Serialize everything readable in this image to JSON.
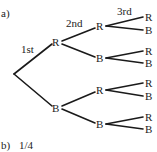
{
  "part_a": {
    "label": "a)",
    "stage_labels": [
      "1st",
      "2nd",
      "3rd"
    ],
    "tree": {
      "level1": [
        "R",
        "B"
      ],
      "level2": [
        "R",
        "B",
        "R",
        "B"
      ],
      "level3": [
        "R",
        "B",
        "R",
        "B",
        "R",
        "B",
        "R",
        "B"
      ]
    }
  },
  "part_b": {
    "label": "b)",
    "answer": "1/4"
  },
  "colors": {
    "ink": "#1a1a1a",
    "background": "#ffffff"
  }
}
